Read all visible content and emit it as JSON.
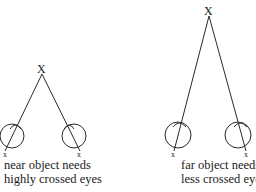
{
  "diagrams": [
    {
      "id": "near",
      "target_label": "X",
      "eye_labels": [
        "x",
        "x"
      ],
      "caption_line1": "near object needs",
      "caption_line2": "highly crossed eyes"
    },
    {
      "id": "far",
      "target_label": "X",
      "eye_labels": [
        "x",
        "x"
      ],
      "caption_line1": "far object needs",
      "caption_line2": "less crossed eyes"
    }
  ],
  "colors": {
    "stroke": "#2a2a2a",
    "background": "#ffffff"
  }
}
